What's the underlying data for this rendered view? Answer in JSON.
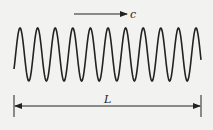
{
  "diagram": {
    "type": "traveling-wave",
    "velocity_label": "c",
    "length_label": "L",
    "wave": {
      "x_start": 14,
      "x_end": 201,
      "midline_y": 54.5,
      "amplitude": 26.5,
      "period_px": 17.6,
      "start_phase": -0.58,
      "peak_count": 11
    },
    "colors": {
      "background": "#f2f2f0",
      "stroke": "#222222"
    }
  }
}
